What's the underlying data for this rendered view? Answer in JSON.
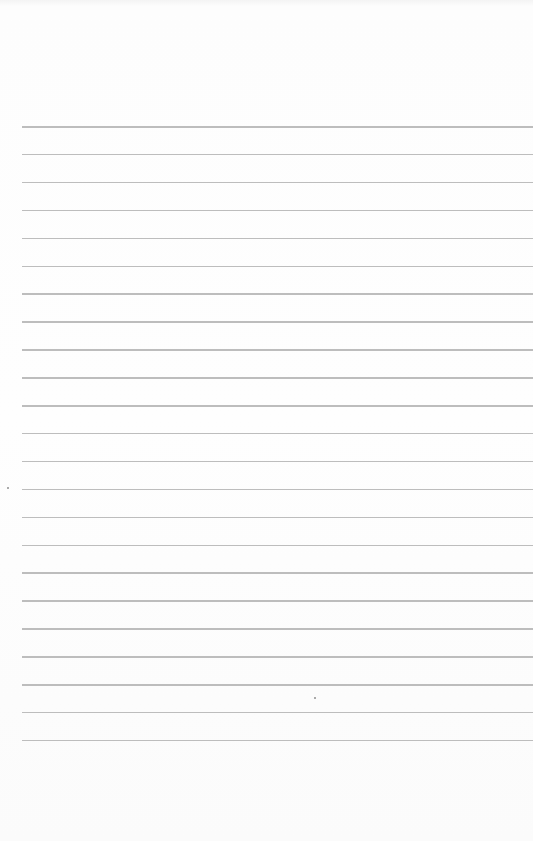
{
  "page": {
    "type": "lined-paper",
    "background_color": "#fdfdfd",
    "line_color": "#bdbdbd",
    "line_count": 23,
    "first_line_y": 126,
    "line_spacing": 27.9,
    "left_margin": 22
  }
}
